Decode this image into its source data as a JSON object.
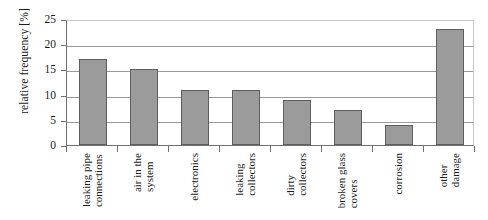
{
  "chart_data": {
    "type": "bar",
    "title": "",
    "xlabel": "",
    "ylabel": "relative frequency [%]",
    "categories": [
      "leaking pipe connections",
      "air in the system",
      "electronics",
      "leaking collectors",
      "dirty collectors",
      "broken glass covers",
      "corrosion",
      "other damage"
    ],
    "category_lines": [
      [
        "leaking pipe",
        "connections"
      ],
      [
        "air in the",
        "system"
      ],
      [
        "electronics"
      ],
      [
        "leaking",
        "collectors"
      ],
      [
        "dirty",
        "collectors"
      ],
      [
        "broken glass",
        "covers"
      ],
      [
        "corrosion"
      ],
      [
        "other",
        "damage"
      ]
    ],
    "values": [
      17,
      15,
      11,
      11,
      9,
      7,
      4,
      23
    ],
    "ylim": [
      0,
      25
    ],
    "yticks": [
      0,
      5,
      10,
      15,
      20,
      25
    ],
    "ytick_labels": [
      "0",
      "5",
      "10",
      "15",
      "20",
      "25"
    ],
    "grid": true,
    "legend": false,
    "bar_color": "#9b9b9b",
    "bar_border_color": "#5e5e5e",
    "axis_color": "#6f6f6f",
    "gridline_color": "#9a9a9a"
  }
}
